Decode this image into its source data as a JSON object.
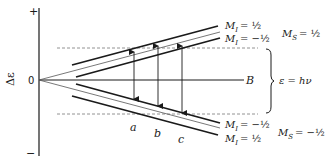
{
  "diagram": {
    "y_axis": {
      "label": "Δε",
      "plus": "+",
      "minus": "−",
      "origin": "0"
    },
    "x_axis": {
      "label": "B"
    },
    "resonance": {
      "label": "ε = hν"
    },
    "transitions": [
      "a",
      "b",
      "c"
    ],
    "upper_levels": {
      "ms_label": "M",
      "ms_sub": "S",
      "ms_value": "= ½",
      "mi_top": {
        "label": "M",
        "sub": "I",
        "value": "= ½"
      },
      "mi_bottom": {
        "label": "M",
        "sub": "I",
        "value": "= −½"
      }
    },
    "lower_levels": {
      "ms_label": "M",
      "ms_sub": "S",
      "ms_value": "= −½",
      "mi_top": {
        "label": "M",
        "sub": "I",
        "value": "= −½"
      },
      "mi_bottom": {
        "label": "M",
        "sub": "I",
        "value": "= ½"
      }
    },
    "colors": {
      "line": "#1a1a1a",
      "thin": "#555555",
      "dashed": "#777777"
    }
  }
}
